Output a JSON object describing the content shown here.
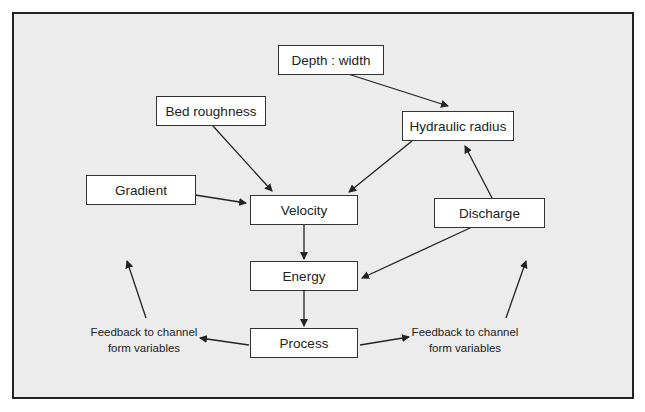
{
  "nodes": {
    "depth_width": "Depth : width",
    "bed_roughness": "Bed roughness",
    "hydraulic_radius": "Hydraulic radius",
    "gradient": "Gradient",
    "velocity": "Velocity",
    "discharge": "Discharge",
    "energy": "Energy",
    "process": "Process"
  },
  "feedback_left": {
    "line1": "Feedback to channel",
    "line2": "form variables"
  },
  "feedback_right": {
    "line1": "Feedback to channel",
    "line2": "form variables"
  },
  "edges": [
    [
      "depth_width",
      "hydraulic_radius"
    ],
    [
      "bed_roughness",
      "velocity"
    ],
    [
      "hydraulic_radius",
      "velocity"
    ],
    [
      "gradient",
      "velocity"
    ],
    [
      "discharge",
      "hydraulic_radius"
    ],
    [
      "discharge",
      "energy"
    ],
    [
      "velocity",
      "energy"
    ],
    [
      "energy",
      "process"
    ],
    [
      "process",
      "feedback_left"
    ],
    [
      "process",
      "feedback_right"
    ]
  ]
}
